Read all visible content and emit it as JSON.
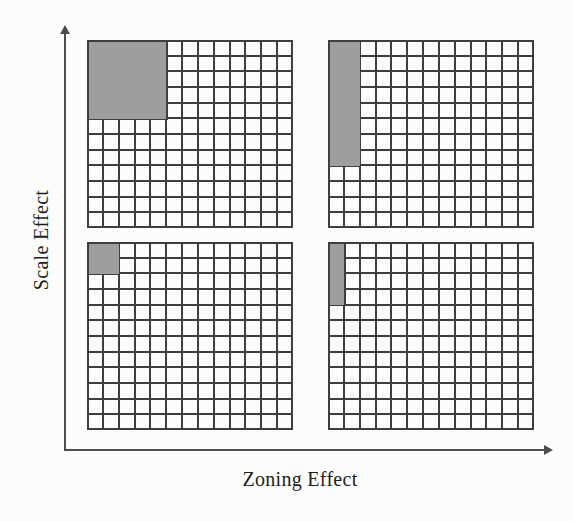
{
  "figure": {
    "y_axis": {
      "label": "Scale Effect"
    },
    "x_axis": {
      "label": "Zoning Effect"
    },
    "colors": {
      "shaded_zone": "#9e9e9e",
      "grid_line": "#3e3e3e",
      "axis": "#4d4d4d",
      "paper": "#fcfcfb"
    },
    "panels": [
      {
        "id": "top-left",
        "cols": 13,
        "rows": 12,
        "shaded_zone": {
          "col": 0,
          "row": 0,
          "col_span": 5,
          "row_span": 5
        }
      },
      {
        "id": "top-right",
        "cols": 13,
        "rows": 12,
        "shaded_zone": {
          "col": 0,
          "row": 0,
          "col_span": 2,
          "row_span": 8
        }
      },
      {
        "id": "bottom-left",
        "cols": 13,
        "rows": 12,
        "shaded_zone": {
          "col": 0,
          "row": 0,
          "col_span": 2,
          "row_span": 2
        }
      },
      {
        "id": "bottom-right",
        "cols": 13,
        "rows": 12,
        "shaded_zone": {
          "col": 0,
          "row": 0,
          "col_span": 1,
          "row_span": 4
        }
      }
    ]
  }
}
